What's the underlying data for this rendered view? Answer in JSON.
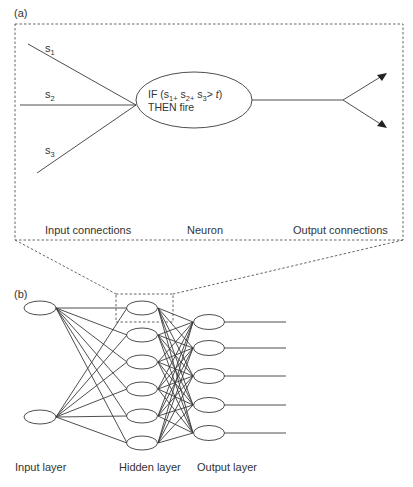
{
  "panel_a": {
    "label": "(a)",
    "inputs": [
      {
        "base": "s",
        "sub": "1"
      },
      {
        "base": "s",
        "sub": "2"
      },
      {
        "base": "s",
        "sub": "3"
      }
    ],
    "neuron": {
      "line1_prefix": "IF (s",
      "line1_sub1": "1+",
      "line1_mid1": " s",
      "line1_sub2": "2+",
      "line1_mid2": " s",
      "line1_sub3": "3",
      "line1_suffix": "> ",
      "threshold": "t",
      "close": ")",
      "line2": "THEN fire"
    },
    "captions": {
      "input": "Input connections",
      "neuron": "Neuron",
      "output": "Output connections"
    }
  },
  "panel_b": {
    "label": "(b)",
    "layers": {
      "input": {
        "label": "Input layer",
        "nodes": 2
      },
      "hidden": {
        "label": "Hidden layer",
        "nodes": 6
      },
      "output": {
        "label": "Output layer",
        "nodes": 5
      }
    }
  },
  "colors": {
    "stroke": "#3a3a3a",
    "text": "#333333",
    "background": "#ffffff"
  }
}
